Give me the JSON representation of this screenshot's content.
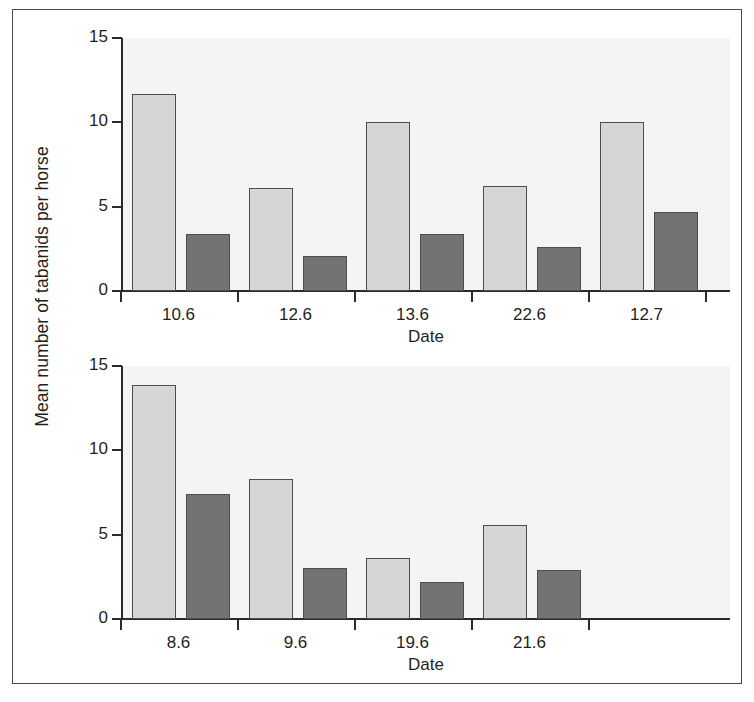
{
  "figure": {
    "yaxis_title": "Mean number of tabanids per horse",
    "light_bar_color": "#d6d6d6",
    "dark_bar_color": "#737373",
    "bar_outline_color": "#4d4d4d",
    "plot_background": "#f4f4f4",
    "axis_color": "#2b2b2b",
    "frame_color": "#4a4a4a"
  },
  "chart_data": [
    {
      "type": "bar",
      "panel": "top",
      "title": "",
      "xlabel": "Date",
      "ylabel": "Mean number of tabanids per horse",
      "categories": [
        "10.6",
        "12.6",
        "13.6",
        "22.6",
        "12.7"
      ],
      "yticks": [
        "0",
        "5",
        "10",
        "15"
      ],
      "ytick_values": [
        0,
        5,
        10,
        15
      ],
      "ylim": [
        0,
        15
      ],
      "grid": false,
      "legend": "none",
      "series": [
        {
          "name": "light",
          "color": "#d6d6d6",
          "values": [
            11.7,
            6.1,
            10.0,
            6.2,
            10.0
          ]
        },
        {
          "name": "dark",
          "color": "#737373",
          "values": [
            3.4,
            2.1,
            3.4,
            2.6,
            4.7
          ]
        }
      ]
    },
    {
      "type": "bar",
      "panel": "bottom",
      "title": "",
      "xlabel": "Date",
      "ylabel": "Mean number of tabanids per horse",
      "categories": [
        "8.6",
        "9.6",
        "19.6",
        "21.6"
      ],
      "yticks": [
        "0",
        "5",
        "10",
        "15"
      ],
      "ytick_values": [
        0,
        5,
        10,
        15
      ],
      "ylim": [
        0,
        15
      ],
      "grid": false,
      "legend": "none",
      "series": [
        {
          "name": "light",
          "color": "#d6d6d6",
          "values": [
            13.9,
            8.3,
            3.6,
            5.6
          ]
        },
        {
          "name": "dark",
          "color": "#737373",
          "values": [
            7.4,
            3.0,
            2.2,
            2.9
          ]
        }
      ]
    }
  ]
}
